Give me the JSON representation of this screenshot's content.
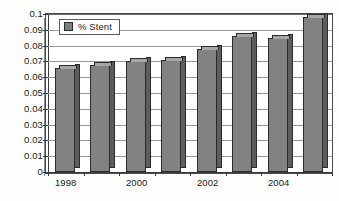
{
  "chart_data": {
    "type": "bar",
    "title": "",
    "subtitle": "",
    "xlabel": "",
    "ylabel": "",
    "categories": [
      "1998",
      "1999",
      "2000",
      "2001",
      "2002",
      "2003",
      "2004",
      "2005"
    ],
    "visible_tick_labels": [
      "1998",
      "",
      "2000",
      "",
      "2002",
      "",
      "2004",
      ""
    ],
    "series": [
      {
        "name": "% Stent",
        "values": [
          0.066,
          0.068,
          0.07,
          0.071,
          0.078,
          0.086,
          0.085,
          0.098
        ],
        "color": "#828282"
      }
    ],
    "ylim": [
      0,
      0.1
    ],
    "ytick_values": [
      0,
      0.01,
      0.02,
      0.03,
      0.04,
      0.05,
      0.06,
      0.07,
      0.08,
      0.09,
      0.1
    ],
    "ytick_labels": [
      "0",
      "0.01",
      "0.02",
      "0.03",
      "0.04",
      "0.05",
      "0.06",
      "0.07",
      "0.08",
      "0.09",
      "0.1"
    ],
    "grid": true,
    "grid_axis": "y",
    "legend": {
      "position": "inside-top-left",
      "entries": [
        {
          "label": "% Stent",
          "swatch_color": "#7e7e7e"
        }
      ]
    },
    "style": {
      "three_d": true,
      "bar_fill": "#828282",
      "bar_side": "#5d5d5d",
      "bar_top": "#a6a6a6",
      "bar_outline": "#2b2b2b",
      "gridline_color": "#9a9a9a",
      "axis_color": "#3a3a3a",
      "plot_background": "#ffffff",
      "figure_background": "#fdfdfb"
    }
  }
}
